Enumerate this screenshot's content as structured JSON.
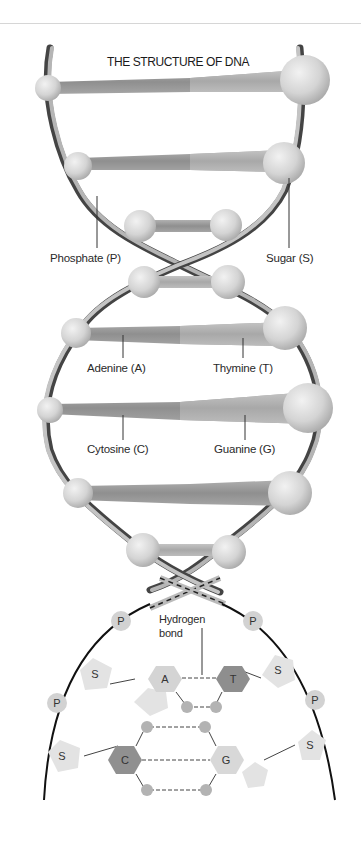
{
  "diagram": {
    "title": "THE STRUCTURE OF DNA",
    "labels": {
      "phosphate": "Phosphate (P)",
      "sugar": "Sugar (S)",
      "adenine": "Adenine (A)",
      "thymine": "Thymine (T)",
      "cytosine": "Cytosine (C)",
      "guanine": "Guanine (G)",
      "hydrogen_bond_line1": "Hydrogen",
      "hydrogen_bond_line2": "bond"
    },
    "detail": {
      "phosphate_symbol": "P",
      "sugar_symbol": "S",
      "adenine_symbol": "A",
      "thymine_symbol": "T",
      "cytosine_symbol": "C",
      "guanine_symbol": "G"
    },
    "colors": {
      "strand_light": "#b9b9b9",
      "strand_dark": "#555555",
      "sphere": "#d8d8d8",
      "base_light": "#c2c2c2",
      "base_dark": "#8a8a8a",
      "thymine_hex": "#8e8e8e",
      "cytosine_hex": "#909090",
      "sugar_pentagon": "#e6e6e6",
      "phosphate_circle": "#d4d4d4",
      "backbone_line": "#111111"
    }
  }
}
